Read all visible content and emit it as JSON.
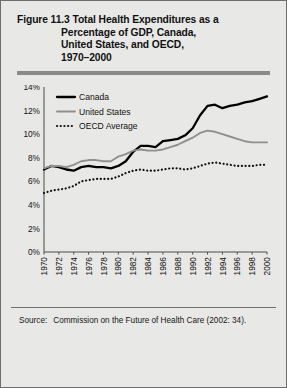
{
  "figure": {
    "number": "Figure 11.3",
    "title_lines": [
      "Figure 11.3 Total Health Expenditures as a",
      "Percentage of GDP, Canada,",
      "United States, and OECD,",
      "1970–2000"
    ],
    "source_label": "Source:",
    "source_text": "Commission on the Future of Health Care (2002: 34)."
  },
  "colors": {
    "background": "#e8e8e6",
    "border": "#6e6e6e",
    "rule": "#8a8a8a",
    "canada": "#000000",
    "united_states": "#8f8f8f",
    "oecd": "#111111",
    "axis": "#4a4a4a",
    "text": "#121212"
  },
  "chart_data": {
    "type": "line",
    "title": "Total Health Expenditures as a Percentage of GDP, Canada, United States, and OECD, 1970–2000",
    "xlabel": "",
    "ylabel": "",
    "ylim": [
      0,
      14
    ],
    "xlim": [
      1970,
      2000
    ],
    "ytick_labels": [
      "0%",
      "2%",
      "4%",
      "6%",
      "8%",
      "10%",
      "12%",
      "14%"
    ],
    "ytick_values": [
      0,
      2,
      4,
      6,
      8,
      10,
      12,
      14
    ],
    "xtick_labels": [
      "1970",
      "1972",
      "1974",
      "1976",
      "1978",
      "1980",
      "1982",
      "1984",
      "1986",
      "1988",
      "1990",
      "1992",
      "1994",
      "1996",
      "1998",
      "2000"
    ],
    "grid": false,
    "legend_position": "top-left",
    "x": [
      1970,
      1971,
      1972,
      1973,
      1974,
      1975,
      1976,
      1977,
      1978,
      1979,
      1980,
      1981,
      1982,
      1983,
      1984,
      1985,
      1986,
      1987,
      1988,
      1989,
      1990,
      1991,
      1992,
      1993,
      1994,
      1995,
      1996,
      1997,
      1998,
      1999,
      2000
    ],
    "series": [
      {
        "name": "Canada",
        "style": "solid-thick",
        "color": "#000000",
        "values": [
          7.0,
          7.3,
          7.2,
          7.0,
          6.9,
          7.2,
          7.3,
          7.2,
          7.2,
          7.1,
          7.3,
          7.6,
          8.3,
          8.6,
          8.6,
          8.5,
          8.8,
          8.8,
          8.9,
          9.1,
          9.4,
          10.2,
          10.8,
          10.9,
          10.6,
          10.7,
          10.6,
          10.6,
          10.7,
          10.8,
          10.9
        ],
        "display_values": [
          7.0,
          7.3,
          7.2,
          7.0,
          6.9,
          7.2,
          7.3,
          7.2,
          7.2,
          7.1,
          7.3,
          7.7,
          8.5,
          9.0,
          9.0,
          8.9,
          9.4,
          9.5,
          9.6,
          9.9,
          10.5,
          11.6,
          12.4,
          12.5,
          12.2,
          12.4,
          12.5,
          12.7,
          12.8,
          13.0,
          13.2
        ]
      },
      {
        "name": "United States",
        "style": "solid-medium",
        "color": "#8f8f8f",
        "values": [
          7.1,
          7.3,
          7.4,
          7.3,
          7.6,
          7.9,
          8.1,
          8.2,
          8.1,
          8.1,
          8.8,
          9.2,
          9.7,
          9.8,
          9.7,
          9.8,
          10.0,
          10.2,
          10.6,
          10.9,
          11.2,
          11.6,
          12.0,
          11.9,
          11.8,
          11.7,
          11.6,
          11.6,
          11.7,
          11.8,
          12.0
        ],
        "display_values": [
          7.1,
          7.3,
          7.3,
          7.2,
          7.4,
          7.7,
          7.8,
          7.8,
          7.7,
          7.7,
          8.1,
          8.3,
          8.6,
          8.7,
          8.6,
          8.6,
          8.7,
          8.9,
          9.1,
          9.4,
          9.7,
          10.1,
          10.3,
          10.2,
          10.0,
          9.8,
          9.6,
          9.4,
          9.3,
          9.3,
          9.3
        ]
      },
      {
        "name": "OECD Average",
        "style": "dotted",
        "color": "#111111",
        "values": [
          5.0,
          5.2,
          5.3,
          5.4,
          5.6,
          6.0,
          6.1,
          6.2,
          6.2,
          6.2,
          6.4,
          6.7,
          6.9,
          7.0,
          6.9,
          6.9,
          7.0,
          7.1,
          7.1,
          7.0,
          7.1,
          7.3,
          7.5,
          7.6,
          7.5,
          7.4,
          7.3,
          7.3,
          7.3,
          7.4,
          7.4
        ],
        "display_values": [
          5.0,
          5.2,
          5.3,
          5.4,
          5.6,
          6.0,
          6.1,
          6.2,
          6.2,
          6.2,
          6.4,
          6.7,
          6.9,
          7.0,
          6.9,
          6.9,
          7.0,
          7.1,
          7.1,
          7.0,
          7.1,
          7.3,
          7.5,
          7.6,
          7.5,
          7.4,
          7.3,
          7.3,
          7.3,
          7.4,
          7.4
        ]
      }
    ],
    "legend": [
      "Canada",
      "United States",
      "OECD Average"
    ]
  }
}
